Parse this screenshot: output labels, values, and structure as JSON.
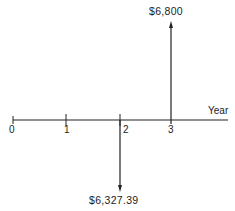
{
  "diagram": {
    "type": "cash-flow-diagram",
    "axis_label": "Year",
    "ticks": [
      "0",
      "1",
      "2",
      "3"
    ],
    "cash_flows": [
      {
        "year": "3",
        "direction": "up",
        "amount": "$6,800"
      },
      {
        "year": "2",
        "direction": "down",
        "amount": "$6,327.39"
      }
    ]
  },
  "colors": {
    "line": "#222222",
    "background": "#ffffff"
  }
}
